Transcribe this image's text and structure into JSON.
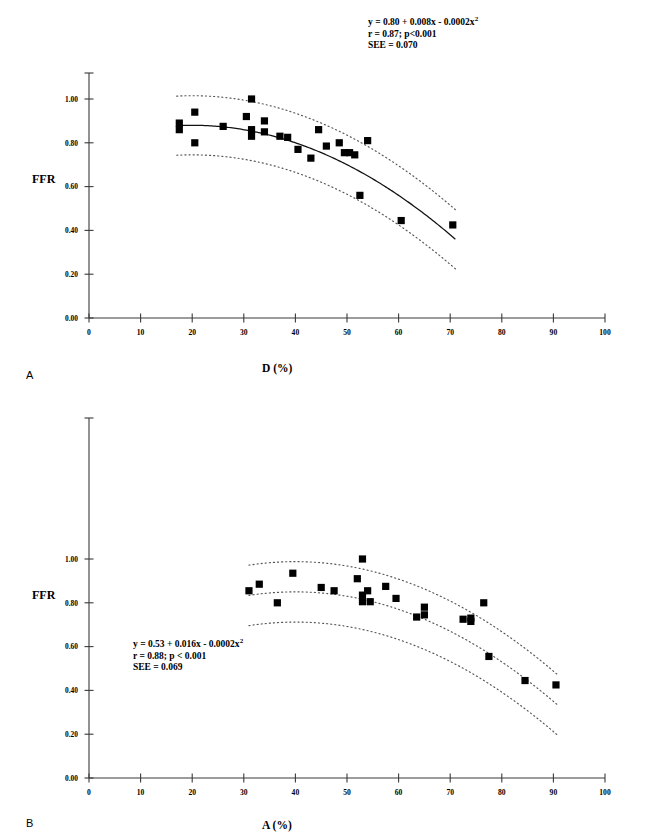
{
  "figure": {
    "type": "scatter-regression-two-panel",
    "ylabel": "FFR",
    "background": "#ffffff",
    "marker_color": "#000000"
  },
  "chart_data": [
    {
      "id": "panel-a",
      "type": "scatter",
      "panel_letter": "A",
      "title": "",
      "xlabel": "D (%)",
      "ylabel": "FFR",
      "xlim": [
        0,
        100
      ],
      "ylim": [
        0.0,
        1.12
      ],
      "xticks": [
        0,
        10,
        20,
        30,
        40,
        50,
        60,
        70,
        80,
        90,
        100
      ],
      "xtick_labels": [
        "0",
        "10",
        "20",
        "30",
        "40",
        "50",
        "60",
        "70",
        "80",
        "90",
        "100"
      ],
      "yticks": [
        0.0,
        0.2,
        0.4,
        0.6,
        0.8,
        1.0
      ],
      "ytick_labels": [
        "0.00",
        "0.20",
        "0.40",
        "0.60",
        "0.80",
        "1.00"
      ],
      "grid": false,
      "legend": "none",
      "annotation": {
        "equation": "y  = 0.80 + 0.008x - 0.0002x",
        "equation_exponent": "2",
        "correlation": "r = 0.87;  p<0.001",
        "see": "SEE = 0.070"
      },
      "fit": {
        "kind": "quadratic",
        "intercept": 0.8,
        "linear": 0.008,
        "quadratic": -0.0002,
        "x_range": [
          17,
          71
        ],
        "band_offset": 0.135
      },
      "points": [
        {
          "x": 17.5,
          "y": 0.89
        },
        {
          "x": 17.5,
          "y": 0.86
        },
        {
          "x": 20.5,
          "y": 0.94
        },
        {
          "x": 20.5,
          "y": 0.8
        },
        {
          "x": 26.0,
          "y": 0.875
        },
        {
          "x": 30.5,
          "y": 0.92
        },
        {
          "x": 31.5,
          "y": 1.0
        },
        {
          "x": 31.5,
          "y": 0.83
        },
        {
          "x": 31.5,
          "y": 0.86
        },
        {
          "x": 34.0,
          "y": 0.9
        },
        {
          "x": 34.0,
          "y": 0.85
        },
        {
          "x": 37.0,
          "y": 0.83
        },
        {
          "x": 38.5,
          "y": 0.825
        },
        {
          "x": 40.5,
          "y": 0.77
        },
        {
          "x": 43.0,
          "y": 0.73
        },
        {
          "x": 44.5,
          "y": 0.86
        },
        {
          "x": 46.0,
          "y": 0.785
        },
        {
          "x": 48.5,
          "y": 0.8
        },
        {
          "x": 49.5,
          "y": 0.755
        },
        {
          "x": 50.5,
          "y": 0.755
        },
        {
          "x": 51.5,
          "y": 0.745
        },
        {
          "x": 54.0,
          "y": 0.81
        },
        {
          "x": 52.5,
          "y": 0.56
        },
        {
          "x": 60.5,
          "y": 0.445
        },
        {
          "x": 70.5,
          "y": 0.425
        }
      ]
    },
    {
      "id": "panel-b",
      "type": "scatter",
      "panel_letter": "B",
      "title": "",
      "xlabel": "A (%)",
      "ylabel": "FFR",
      "xlim": [
        0,
        100
      ],
      "ylim": [
        0.0,
        1.12
      ],
      "xticks": [
        0,
        10,
        20,
        30,
        40,
        50,
        60,
        70,
        80,
        90,
        100
      ],
      "xtick_labels": [
        "0",
        "10",
        "20",
        "30",
        "40",
        "50",
        "60",
        "70",
        "80",
        "90",
        "100"
      ],
      "yticks": [
        0.0,
        0.2,
        0.4,
        0.6,
        0.8,
        1.0
      ],
      "ytick_labels": [
        "0.00",
        "0.20",
        "0.40",
        "0.60",
        "0.80",
        "1.00"
      ],
      "grid": false,
      "legend": "none",
      "annotation": {
        "equation": "y  = 0.53 + 0.016x - 0.0002x",
        "equation_exponent": "2",
        "correlation": "r = 0.88; p < 0.001",
        "see": "SEE = 0.069"
      },
      "fit": {
        "kind": "quadratic",
        "intercept": 0.53,
        "linear": 0.016,
        "quadratic": -0.0002,
        "x_range": [
          31,
          91
        ],
        "band_offset": 0.138
      },
      "points": [
        {
          "x": 31.0,
          "y": 0.855
        },
        {
          "x": 33.0,
          "y": 0.885
        },
        {
          "x": 36.5,
          "y": 0.8
        },
        {
          "x": 39.5,
          "y": 0.935
        },
        {
          "x": 45.0,
          "y": 0.87
        },
        {
          "x": 47.5,
          "y": 0.855
        },
        {
          "x": 52.0,
          "y": 0.91
        },
        {
          "x": 53.0,
          "y": 1.0
        },
        {
          "x": 54.0,
          "y": 0.855
        },
        {
          "x": 53.0,
          "y": 0.835
        },
        {
          "x": 53.0,
          "y": 0.805
        },
        {
          "x": 54.5,
          "y": 0.805
        },
        {
          "x": 57.5,
          "y": 0.875
        },
        {
          "x": 59.5,
          "y": 0.82
        },
        {
          "x": 63.5,
          "y": 0.735
        },
        {
          "x": 65.0,
          "y": 0.78
        },
        {
          "x": 65.0,
          "y": 0.745
        },
        {
          "x": 72.5,
          "y": 0.725
        },
        {
          "x": 74.0,
          "y": 0.73
        },
        {
          "x": 74.0,
          "y": 0.715
        },
        {
          "x": 76.5,
          "y": 0.8
        },
        {
          "x": 77.5,
          "y": 0.555
        },
        {
          "x": 84.5,
          "y": 0.445
        },
        {
          "x": 90.5,
          "y": 0.425
        }
      ]
    }
  ]
}
